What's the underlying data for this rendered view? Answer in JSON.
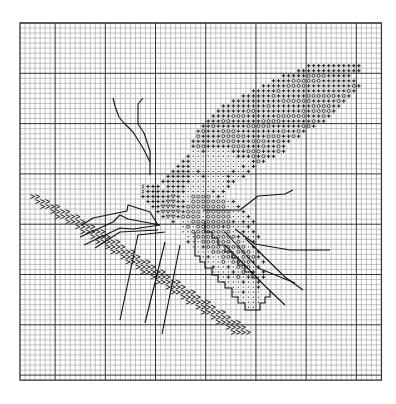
{
  "pattern": {
    "title": "",
    "grid": {
      "left": 20,
      "top": 23,
      "cols": 72,
      "rows": 71,
      "cell_w": 5.02,
      "cell_h": 5.03,
      "major_every": 10,
      "major_col_offset": 7,
      "major_row_offset": 10,
      "minor_color": "#9a9a9a",
      "major_color": "#333333",
      "border_color": "#333333"
    },
    "symbol_color": "#222222",
    "legend": {
      "+": "cross",
      "o": "circle",
      ".": "dot",
      "v": "triangle-down",
      "s": "s-mark",
      ">": "chevron"
    },
    "rows": [
      {
        "r": 8,
        "c": 57,
        "s": "+++++++++++"
      },
      {
        "r": 9,
        "c": 55,
        "s": "+++++++++++++"
      },
      {
        "r": 10,
        "c": 52,
        "s": "+++++oooo+++++"
      },
      {
        "r": 11,
        "c": 50,
        "s": "++++oooooo+++++++"
      },
      {
        "r": 12,
        "c": 48,
        "s": "+++++oooo+++++++++o+"
      },
      {
        "r": 13,
        "c": 46,
        "s": "+++++o+++++++++++++o+"
      },
      {
        "r": 14,
        "c": 44,
        "s": "++++++o++++++oooooo+o+"
      },
      {
        "r": 15,
        "c": 42,
        "s": "++++++++++oooooo+++++o+"
      },
      {
        "r": 16,
        "c": 40,
        "s": "+++++++++o++++++++oooo++"
      },
      {
        "r": 17,
        "c": 39,
        "s": "++++++oo+++++++++o+oooo+"
      },
      {
        "r": 18,
        "c": 38,
        "s": "++++ooo++++++oooooo+++o+"
      },
      {
        "r": 19,
        "c": 37,
        "s": "+++oo++++++oooo++++++o++"
      },
      {
        "r": 20,
        "c": 36,
        "s": "++o++++++ooooo++++++oo+"
      },
      {
        "r": 21,
        "c": 35,
        "s": "+o+++ooo+++++++++o++o+"
      },
      {
        "r": 22,
        "c": 35,
        "s": "o++++ooooo++++ooo++o+"
      },
      {
        "r": 23,
        "c": 34,
        "s": "+++++oooo+++ooo++o++"
      },
      {
        "r": 24,
        "c": 34,
        "s": "+oo+++++ooo+++o++o+"
      },
      {
        "r": 25,
        "c": 34,
        "s": "..+.....+++ooo+++o+"
      },
      {
        "r": 26,
        "c": 33,
        "s": "+.........+++o+o++"
      },
      {
        "r": 27,
        "c": 32,
        "s": "++............+o+"
      },
      {
        "r": 28,
        "c": 31,
        "s": "+++..........+.+"
      },
      {
        "r": 29,
        "c": 30,
        "s": "++++.+......+..+"
      },
      {
        "r": 30,
        "c": 29,
        "s": "+++++..+....+..+"
      },
      {
        "r": 31,
        "c": 28,
        "s": "++++++.......++"
      },
      {
        "r": 32,
        "c": 24,
        "s": "s+++ ++++........+"
      },
      {
        "r": 33,
        "c": 24,
        "s": "s++++++++.....+.+"
      },
      {
        "r": 34,
        "c": 24,
        "s": "++++++v+..oooo.+."
      },
      {
        "r": 35,
        "c": 25,
        "s": "++++vv++.ooooooo.+"
      },
      {
        "r": 36,
        "c": 26,
        "s": "++vvv++oooooooo..+"
      },
      {
        "r": 37,
        "c": 27,
        "s": "+vvvv+ooo.ooooo..+"
      },
      {
        "r": 38,
        "c": 28,
        "s": "+vv+oooo.ooooo...+"
      },
      {
        "r": 39,
        "c": 30,
        "s": "+ ..oooooooo+.+.+"
      },
      {
        "r": 40,
        "c": 32,
        "s": ".o.ooooo+o...+"
      },
      {
        "r": 41,
        "c": 32,
        "s": "..oooooooo..+.+"
      },
      {
        "r": 42,
        "c": 33,
        "s": "..oooooooo+...+"
      },
      {
        "r": 43,
        "c": 33,
        "s": "+..oooooo.o..+"
      },
      {
        "r": 44,
        "c": 34,
        "s": "..+ooo.oooo.+"
      },
      {
        "r": 45,
        "c": 35,
        "s": "...oooo.ooo.+"
      },
      {
        "r": 46,
        "c": 36,
        "s": ".+..ooo.ooo+"
      },
      {
        "r": 47,
        "c": 37,
        "s": "...o.oooo+ +"
      },
      {
        "r": 48,
        "c": 38,
        "s": "+..+.ooo.+"
      },
      {
        "r": 49,
        "c": 38,
        "s": "....+.o.+ +"
      },
      {
        "r": 50,
        "c": 39,
        "s": "..+.o.+..+"
      },
      {
        "r": 51,
        "c": 40,
        "s": "....+..+"
      },
      {
        "r": 52,
        "c": 41,
        "s": "......+"
      },
      {
        "r": 53,
        "c": 42,
        "s": "..+..."
      },
      {
        "r": 54,
        "c": 43,
        "s": "....."
      },
      {
        "r": 55,
        "c": 44,
        "s": "...."
      },
      {
        "r": 56,
        "c": 45,
        "s": ".."
      }
    ],
    "zigzag": [
      {
        "r": 34,
        "c": 2,
        "s": ">>"
      },
      {
        "r": 35,
        "c": 3,
        "s": ">>>"
      },
      {
        "r": 36,
        "c": 4,
        "s": ">>>>"
      },
      {
        "r": 37,
        "c": 6,
        "s": ">>>>"
      },
      {
        "r": 38,
        "c": 7,
        "s": ">>>>>"
      },
      {
        "r": 39,
        "c": 9,
        "s": ">>>>"
      },
      {
        "r": 40,
        "c": 11,
        "s": ">>>>"
      },
      {
        "r": 41,
        "c": 12,
        "s": ">>>>>"
      },
      {
        "r": 42,
        "c": 14,
        "s": ">>>>"
      },
      {
        "r": 43,
        "c": 15,
        "s": ">>>>>"
      },
      {
        "r": 44,
        "c": 17,
        "s": ">>>>"
      },
      {
        "r": 45,
        "c": 18,
        "s": ">>>>>"
      },
      {
        "r": 46,
        "c": 20,
        "s": ">>>>"
      },
      {
        "r": 47,
        "c": 21,
        "s": ">>>>>"
      },
      {
        "r": 48,
        "c": 23,
        "s": ">>>>"
      },
      {
        "r": 49,
        "c": 24,
        "s": ">>>>>"
      },
      {
        "r": 50,
        "c": 26,
        "s": ">>>>"
      },
      {
        "r": 51,
        "c": 27,
        "s": ">>>>>"
      },
      {
        "r": 52,
        "c": 29,
        "s": ">>>>"
      },
      {
        "r": 53,
        "c": 30,
        "s": ">>>>>"
      },
      {
        "r": 54,
        "c": 32,
        "s": ">>>>"
      },
      {
        "r": 55,
        "c": 33,
        "s": ">>>>>"
      },
      {
        "r": 56,
        "c": 35,
        "s": ">>>>"
      },
      {
        "r": 57,
        "c": 36,
        "s": ">>>>>"
      },
      {
        "r": 58,
        "c": 38,
        "s": ">>>>"
      },
      {
        "r": 59,
        "c": 39,
        "s": ">>>>>"
      },
      {
        "r": 60,
        "c": 41,
        "s": ">>>>"
      },
      {
        "r": 61,
        "c": 42,
        "s": ">>>>"
      }
    ],
    "lines": [
      {
        "name": "antenna-left",
        "pts": [
          [
            113,
            98
          ],
          [
            115,
            106
          ],
          [
            119,
            117
          ],
          [
            124,
            123
          ],
          [
            133,
            132
          ],
          [
            143,
            148
          ],
          [
            150,
            162
          ]
        ]
      },
      {
        "name": "antenna-right",
        "pts": [
          [
            143,
            98
          ],
          [
            138,
            104
          ],
          [
            138,
            124
          ],
          [
            144,
            133
          ],
          [
            150,
            151
          ],
          [
            150,
            175
          ]
        ]
      },
      {
        "name": "leg-1",
        "pts": [
          [
            82,
            225
          ],
          [
            93,
            218
          ],
          [
            127,
            211
          ],
          [
            128,
            205
          ],
          [
            150,
            212
          ],
          [
            158,
            225
          ]
        ]
      },
      {
        "name": "leg-2",
        "pts": [
          [
            80,
            237
          ],
          [
            113,
            222
          ],
          [
            120,
            215
          ],
          [
            128,
            219
          ],
          [
            160,
            225
          ]
        ]
      },
      {
        "name": "leg-3",
        "pts": [
          [
            84,
            245
          ],
          [
            120,
            228
          ],
          [
            133,
            229
          ],
          [
            160,
            225
          ]
        ]
      },
      {
        "name": "leg-4",
        "pts": [
          [
            95,
            248
          ],
          [
            120,
            232
          ],
          [
            158,
            230
          ]
        ]
      },
      {
        "name": "leg-5",
        "pts": [
          [
            120,
            320
          ],
          [
            138,
            235
          ],
          [
            165,
            232
          ]
        ]
      },
      {
        "name": "leg-6",
        "pts": [
          [
            145,
            323
          ],
          [
            165,
            242
          ]
        ]
      },
      {
        "name": "leg-7",
        "pts": [
          [
            162,
            334
          ],
          [
            180,
            245
          ]
        ]
      },
      {
        "name": "wing-vein-1",
        "pts": [
          [
            203,
            210
          ],
          [
            240,
            210
          ],
          [
            258,
            196
          ],
          [
            285,
            194
          ],
          [
            293,
            190
          ]
        ]
      },
      {
        "name": "wing-vein-2",
        "pts": [
          [
            235,
            229
          ],
          [
            255,
            244
          ],
          [
            290,
            250
          ],
          [
            330,
            250
          ]
        ]
      },
      {
        "name": "wing-vein-3",
        "pts": [
          [
            225,
            232
          ],
          [
            258,
            268
          ],
          [
            295,
            283
          ]
        ]
      },
      {
        "name": "wing-vein-4",
        "pts": [
          [
            225,
            245
          ],
          [
            265,
            286
          ],
          [
            285,
            305
          ]
        ]
      },
      {
        "name": "wing-vein-5",
        "pts": [
          [
            245,
            238
          ],
          [
            285,
            277
          ],
          [
            303,
            290
          ]
        ]
      },
      {
        "name": "wing-outline-lower",
        "pts": [
          [
            195,
            232
          ],
          [
            195,
            256
          ],
          [
            200,
            256
          ],
          [
            200,
            262
          ],
          [
            205,
            262
          ],
          [
            205,
            268
          ],
          [
            212,
            268
          ],
          [
            212,
            275
          ],
          [
            218,
            275
          ],
          [
            218,
            282
          ],
          [
            225,
            282
          ],
          [
            225,
            288
          ],
          [
            232,
            288
          ],
          [
            232,
            297
          ],
          [
            238,
            297
          ],
          [
            238,
            303
          ],
          [
            245,
            303
          ],
          [
            245,
            310
          ],
          [
            260,
            310
          ],
          [
            260,
            303
          ],
          [
            265,
            303
          ],
          [
            265,
            297
          ],
          [
            270,
            297
          ],
          [
            270,
            290
          ]
        ]
      },
      {
        "name": "wing-outline-inner",
        "pts": [
          [
            205,
            222
          ],
          [
            205,
            232
          ],
          [
            212,
            232
          ],
          [
            212,
            238
          ],
          [
            218,
            238
          ],
          [
            218,
            245
          ],
          [
            225,
            245
          ],
          [
            225,
            252
          ],
          [
            232,
            252
          ],
          [
            232,
            258
          ],
          [
            238,
            258
          ],
          [
            238,
            265
          ],
          [
            245,
            265
          ],
          [
            245,
            272
          ],
          [
            252,
            272
          ],
          [
            252,
            278
          ],
          [
            258,
            278
          ]
        ]
      }
    ]
  }
}
